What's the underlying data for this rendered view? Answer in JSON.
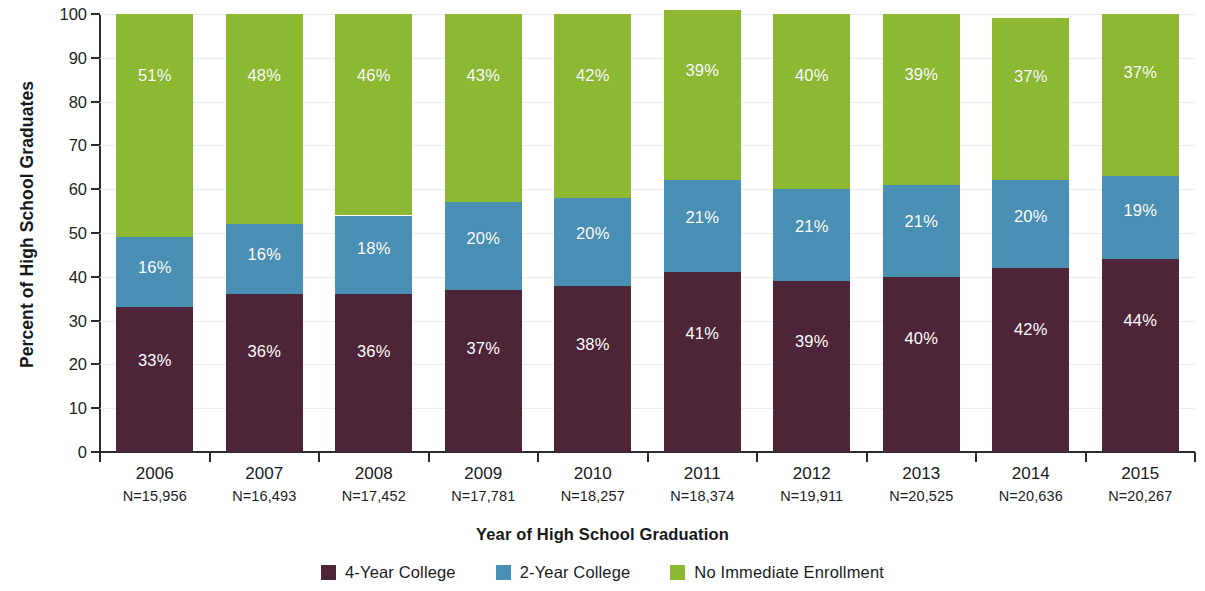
{
  "chart_data": {
    "type": "bar",
    "stacked": true,
    "stack_total": 100,
    "title": "",
    "xlabel": "Year of High School Graduation",
    "ylabel": "Percent of High School Graduates",
    "ylim": [
      0,
      100
    ],
    "ytick_step": 10,
    "grid": true,
    "legend_position": "bottom",
    "categories": [
      "2006",
      "2007",
      "2008",
      "2009",
      "2010",
      "2011",
      "2012",
      "2013",
      "2014",
      "2015"
    ],
    "category_sublabels": [
      "N=15,956",
      "N=16,493",
      "N=17,452",
      "N=17,781",
      "N=18,257",
      "N=18,374",
      "N=19,911",
      "N=20,525",
      "N=20,636",
      "N=20,267"
    ],
    "category_counts": [
      15956,
      16493,
      17452,
      17781,
      18257,
      18374,
      19911,
      20525,
      20636,
      20267
    ],
    "yticks": [
      0,
      10,
      20,
      30,
      40,
      50,
      60,
      70,
      80,
      90,
      100
    ],
    "ytick_labels": [
      "0",
      "10",
      "20",
      "30",
      "40",
      "50",
      "60",
      "70",
      "80",
      "90",
      "100"
    ],
    "series": [
      {
        "name": "4-Year College",
        "color": "#4e2438",
        "values": [
          33,
          36,
          36,
          37,
          38,
          41,
          39,
          40,
          42,
          44
        ],
        "labels": [
          "33%",
          "36%",
          "36%",
          "37%",
          "38%",
          "41%",
          "39%",
          "40%",
          "42%",
          "44%"
        ]
      },
      {
        "name": "2-Year College",
        "color": "#4a90b4",
        "values": [
          16,
          16,
          18,
          20,
          20,
          21,
          21,
          21,
          20,
          19
        ],
        "labels": [
          "16%",
          "16%",
          "18%",
          "20%",
          "20%",
          "21%",
          "21%",
          "21%",
          "20%",
          "19%"
        ]
      },
      {
        "name": "No Immediate Enrollment",
        "color": "#8cb832",
        "values": [
          51,
          48,
          46,
          43,
          42,
          39,
          40,
          39,
          37,
          37
        ],
        "labels": [
          "51%",
          "48%",
          "46%",
          "43%",
          "42%",
          "39%",
          "40%",
          "39%",
          "37%",
          "37%"
        ]
      }
    ]
  },
  "legend": {
    "items": [
      {
        "label": "4-Year College",
        "color": "#4e2438"
      },
      {
        "label": "2-Year College",
        "color": "#4a90b4"
      },
      {
        "label": "No Immediate Enrollment",
        "color": "#8cb832"
      }
    ]
  },
  "axis": {
    "y_title": "Percent of High School Graduates",
    "x_title": "Year of High School Graduation"
  }
}
